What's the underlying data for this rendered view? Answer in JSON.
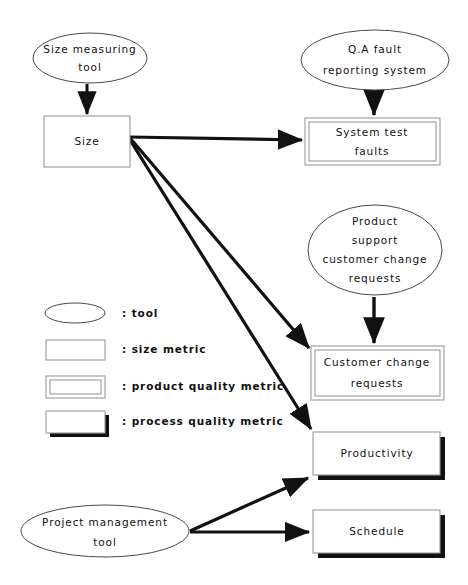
{
  "diagram": {
    "background_color": "#ffffff",
    "line_color": "#111111",
    "box_stroke_color": "#9a9a9a",
    "ellipse_stroke_color": "#4a4a4a",
    "nodes": {
      "size_measuring_tool": {
        "shape": "ellipse",
        "kind": "tool",
        "lines": [
          "Size measuring",
          "tool"
        ]
      },
      "size": {
        "shape": "rectangle",
        "kind": "size metric",
        "lines": [
          "Size"
        ]
      },
      "qa_fault_reporting_system": {
        "shape": "ellipse",
        "kind": "tool",
        "lines": [
          "Q.A fault",
          "reporting system"
        ]
      },
      "system_test_faults": {
        "shape": "double-rectangle",
        "kind": "product quality metric",
        "lines": [
          "System test",
          "faults"
        ]
      },
      "product_support_customer_change_requests": {
        "shape": "ellipse",
        "kind": "tool",
        "lines": [
          "Product",
          "support",
          "customer change",
          "requests"
        ]
      },
      "customer_change_requests": {
        "shape": "double-rectangle",
        "kind": "product quality metric",
        "lines": [
          "Customer change",
          "requests"
        ]
      },
      "productivity": {
        "shape": "shadow-rectangle",
        "kind": "process quality metric",
        "lines": [
          "Productivity"
        ]
      },
      "schedule": {
        "shape": "shadow-rectangle",
        "kind": "process quality metric",
        "lines": [
          "Schedule"
        ]
      },
      "project_management_tool": {
        "shape": "ellipse",
        "kind": "tool",
        "lines": [
          "Project management",
          "tool"
        ]
      }
    },
    "edges": [
      {
        "from": "size_measuring_tool",
        "to": "size"
      },
      {
        "from": "size",
        "to": "system_test_faults"
      },
      {
        "from": "size",
        "to": "customer_change_requests"
      },
      {
        "from": "size",
        "to": "productivity"
      },
      {
        "from": "qa_fault_reporting_system",
        "to": "system_test_faults"
      },
      {
        "from": "product_support_customer_change_requests",
        "to": "customer_change_requests"
      },
      {
        "from": "project_management_tool",
        "to": "productivity"
      },
      {
        "from": "project_management_tool",
        "to": "schedule"
      }
    ],
    "legend": {
      "separator": ":",
      "items": [
        {
          "symbol": "ellipse",
          "label": ": tool"
        },
        {
          "symbol": "rectangle",
          "label": ": size metric"
        },
        {
          "symbol": "double-rectangle",
          "label": ": product quality metric"
        },
        {
          "symbol": "shadow-rectangle",
          "label": ": process quality metric"
        }
      ]
    }
  }
}
